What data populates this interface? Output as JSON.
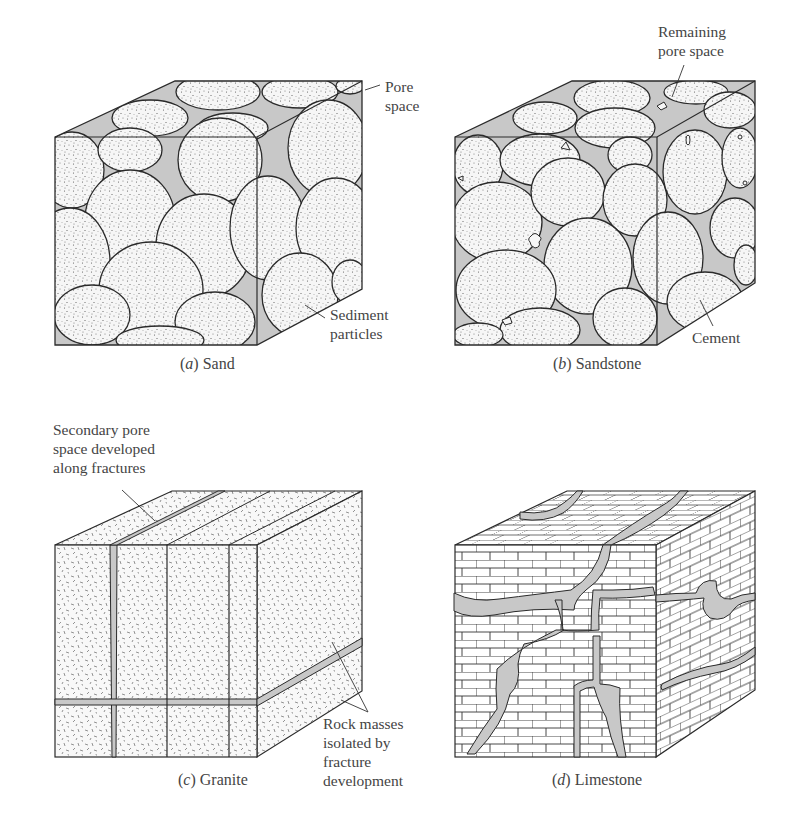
{
  "figure": {
    "panels": [
      {
        "id": "a",
        "caption_letter": "a",
        "caption_text": "Sand",
        "callouts": [
          {
            "line1": "Pore",
            "line2": "space"
          },
          {
            "line1": "Sediment",
            "line2": "particles"
          }
        ]
      },
      {
        "id": "b",
        "caption_letter": "b",
        "caption_text": "Sandstone",
        "callouts": [
          {
            "line1": "Remaining",
            "line2": "pore space"
          },
          {
            "line1": "Cement"
          }
        ]
      },
      {
        "id": "c",
        "caption_letter": "c",
        "caption_text": "Granite",
        "callouts": [
          {
            "line1": "Secondary pore",
            "line2": "space developed",
            "line3": "along fractures"
          },
          {
            "line1": "Rock masses",
            "line2": "isolated by",
            "line3": "fracture",
            "line4": "development"
          }
        ]
      },
      {
        "id": "d",
        "caption_letter": "d",
        "caption_text": "Limestone",
        "callouts": []
      }
    ],
    "colors": {
      "pore_fill": "#c8c8c8",
      "grain_fill": "#f4f4f4",
      "outline": "#2a2a2a",
      "text": "#444444"
    }
  }
}
